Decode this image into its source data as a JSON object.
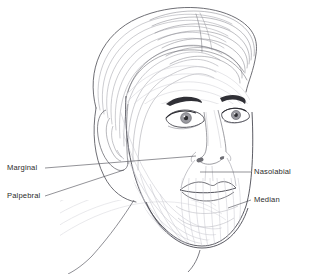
{
  "figure": {
    "background_color": "#ffffff",
    "line_color_dark": "#3a3a3a",
    "line_color_mid": "#8c8c90",
    "line_color_light": "#c9c9cf",
    "text_color": "#2b2b2b",
    "nostril_fill": "#6e6e74",
    "iris_fill": "#9a9aa0",
    "pupil_fill": "#2a2a2e"
  },
  "labels": [
    {
      "id": "marginal",
      "text": "Marginal",
      "side": "left",
      "text_x": 7,
      "text_y": 163,
      "leader": {
        "x1": 45,
        "y1": 168,
        "x2": 196,
        "y2": 156
      }
    },
    {
      "id": "palpebral",
      "text": "Palpebral",
      "side": "left",
      "text_x": 7,
      "text_y": 191,
      "leader": {
        "x1": 45,
        "y1": 196,
        "x2": 124,
        "y2": 170
      }
    },
    {
      "id": "nasolabial",
      "text": "Nasolabial",
      "side": "right",
      "text_x": 254,
      "text_y": 167,
      "leader": {
        "x1": 251,
        "y1": 172,
        "x2": 200,
        "y2": 172
      }
    },
    {
      "id": "median",
      "text": "Median",
      "side": "right",
      "text_x": 254,
      "text_y": 195,
      "leader": {
        "x1": 251,
        "y1": 200,
        "x2": 228,
        "y2": 208
      }
    }
  ],
  "anatomy_parts": [
    "hair",
    "forehead",
    "eyebrow-left",
    "eyebrow-right",
    "eye-left",
    "eye-right",
    "nose",
    "nostrils",
    "upper-lip",
    "lower-lip",
    "chin",
    "cheek",
    "ear",
    "jawline",
    "neck"
  ],
  "line_fields": {
    "description": "relaxed skin tension lines drawn as nested arcs over cheek, forehead, chin and neck",
    "cheek_arc_count": 11,
    "forehead_arc_count": 6,
    "chin_arc_count": 9,
    "neck_arc_count": 7,
    "hair_strand_count": 22
  }
}
